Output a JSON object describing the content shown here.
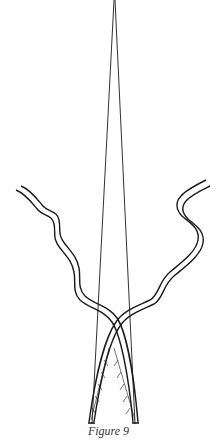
{
  "figure": {
    "caption": "Figure 9",
    "stroke_color": "#1a1a1a",
    "background": "#ffffff",
    "elements": [
      "two thin lines converging to an apex at the top",
      "two wavy double-line strands crossing near the bottom",
      "hatched strips at the lower ends of each strand"
    ]
  }
}
